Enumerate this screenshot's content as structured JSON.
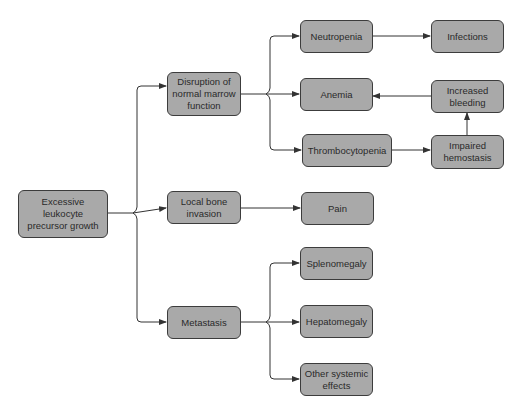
{
  "diagram": {
    "type": "flowchart",
    "colors": {
      "node_fill": "#a9a9a9",
      "node_border": "#3c3c3c",
      "line": "#333333",
      "background": "#ffffff"
    },
    "nodes": {
      "root": {
        "label": "Excessive\nleukocyte\nprecursor growth"
      },
      "disruption": {
        "label": "Disruption of\nnormal marrow\nfunction"
      },
      "local_bone": {
        "label": "Local bone\ninvasion"
      },
      "metastasis": {
        "label": "Metastasis"
      },
      "neutropenia": {
        "label": "Neutropenia"
      },
      "anemia": {
        "label": "Anemia"
      },
      "thrombocytopenia": {
        "label": "Thrombocytopenia"
      },
      "infections": {
        "label": "Infections"
      },
      "increased_bleeding": {
        "label": "Increased\nbleeding"
      },
      "impaired_hemostasis": {
        "label": "Impaired\nhemostasis"
      },
      "pain": {
        "label": "Pain"
      },
      "splenomegaly": {
        "label": "Splenomegaly"
      },
      "hepatomegaly": {
        "label": "Hepatomegaly"
      },
      "other_systemic": {
        "label": "Other systemic\neffects"
      }
    },
    "edges": [
      {
        "from": "root",
        "to": "disruption"
      },
      {
        "from": "root",
        "to": "local_bone"
      },
      {
        "from": "root",
        "to": "metastasis"
      },
      {
        "from": "disruption",
        "to": "neutropenia"
      },
      {
        "from": "disruption",
        "to": "anemia"
      },
      {
        "from": "disruption",
        "to": "thrombocytopenia"
      },
      {
        "from": "neutropenia",
        "to": "infections"
      },
      {
        "from": "thrombocytopenia",
        "to": "impaired_hemostasis"
      },
      {
        "from": "impaired_hemostasis",
        "to": "increased_bleeding"
      },
      {
        "from": "increased_bleeding",
        "to": "anemia"
      },
      {
        "from": "local_bone",
        "to": "pain"
      },
      {
        "from": "metastasis",
        "to": "splenomegaly"
      },
      {
        "from": "metastasis",
        "to": "hepatomegaly"
      },
      {
        "from": "metastasis",
        "to": "other_systemic"
      }
    ]
  }
}
